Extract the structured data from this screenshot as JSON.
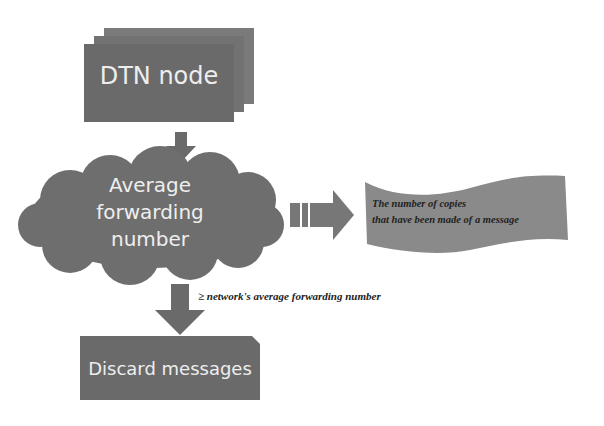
{
  "diagram": {
    "nodes": {
      "dtn_node": {
        "label": "DTN node",
        "shape": "stacked-rectangles"
      },
      "average_forwarding": {
        "label_lines": [
          "Average",
          "forwarding",
          "number"
        ],
        "shape": "cloud"
      },
      "copies_note": {
        "label_lines": [
          "The number of copies",
          "that have been made of a message"
        ],
        "shape": "wave-banner"
      },
      "discard": {
        "label": "Discard messages",
        "shape": "snipped-rectangle"
      }
    },
    "edges": {
      "condition_label": "≥ network's average forwarding number"
    },
    "colors": {
      "shape_fill": "#6e6e6e",
      "shape_fill_dark": "#5c5c5c",
      "banner_fill": "#8a8a8a",
      "text_light": "#eeeeee",
      "text_dark": "#222222"
    }
  }
}
